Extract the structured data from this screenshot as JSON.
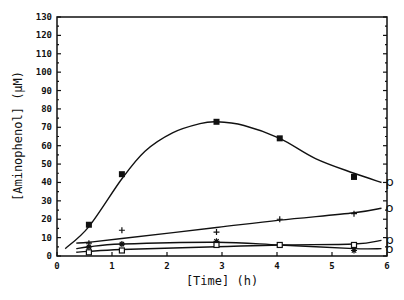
{
  "chart_data": {
    "type": "line",
    "title": "",
    "xlabel": "[Time]  (h)",
    "ylabel": "[Aminophenol]  (μM)",
    "xlim": [
      0,
      6
    ],
    "ylim": [
      0,
      130
    ],
    "xticks": [
      0,
      1,
      2,
      3,
      4,
      5,
      6
    ],
    "yticks": [
      0,
      10,
      20,
      30,
      40,
      50,
      60,
      70,
      80,
      90,
      100,
      110,
      120,
      130
    ],
    "grid": false,
    "legend": null,
    "series": [
      {
        "name": "filled-square",
        "marker": "filled-square",
        "end_label": "p",
        "x": [
          0.58,
          1.18,
          2.9,
          4.05,
          5.4
        ],
        "y": [
          17,
          44.5,
          73,
          64,
          43
        ],
        "curve": [
          [
            0.15,
            4
          ],
          [
            0.58,
            16
          ],
          [
            1.18,
            42
          ],
          [
            1.6,
            57
          ],
          [
            2.1,
            67
          ],
          [
            2.6,
            72
          ],
          [
            2.9,
            73
          ],
          [
            3.4,
            71
          ],
          [
            4.05,
            64
          ],
          [
            4.7,
            53
          ],
          [
            5.4,
            45
          ],
          [
            5.9,
            40
          ]
        ]
      },
      {
        "name": "plus",
        "marker": "plus",
        "end_label": "o",
        "x": [
          0.58,
          1.18,
          2.9,
          4.05,
          5.4
        ],
        "y": [
          7,
          14,
          13,
          20,
          23
        ],
        "curve": [
          [
            0.35,
            7
          ],
          [
            0.58,
            7.5
          ],
          [
            1.18,
            9.5
          ],
          [
            2.9,
            15.5
          ],
          [
            4.05,
            19.5
          ],
          [
            5.4,
            23.5
          ],
          [
            5.9,
            26
          ]
        ]
      },
      {
        "name": "star",
        "marker": "star",
        "end_label": "o",
        "x": [
          0.58,
          1.18,
          2.9,
          4.05,
          5.4
        ],
        "y": [
          5,
          6.5,
          8,
          6,
          3
        ],
        "curve": [
          [
            0.35,
            4
          ],
          [
            0.58,
            5
          ],
          [
            1.18,
            6.5
          ],
          [
            2.9,
            7.5
          ],
          [
            4.05,
            6
          ],
          [
            5.4,
            4
          ],
          [
            5.9,
            4
          ]
        ]
      },
      {
        "name": "open-square",
        "marker": "open-square",
        "end_label": "p",
        "x": [
          0.58,
          1.18,
          2.9,
          4.05,
          5.4
        ],
        "y": [
          2,
          3,
          6,
          6,
          6
        ],
        "curve": [
          [
            0.35,
            2
          ],
          [
            0.58,
            2.5
          ],
          [
            1.18,
            3.5
          ],
          [
            2.9,
            5
          ],
          [
            4.05,
            6
          ],
          [
            5.4,
            6.5
          ],
          [
            5.9,
            8.5
          ]
        ]
      }
    ]
  },
  "labels": {
    "x_title": "[Time]  (h)",
    "y_title": "[Aminophenol]  (μM)"
  }
}
